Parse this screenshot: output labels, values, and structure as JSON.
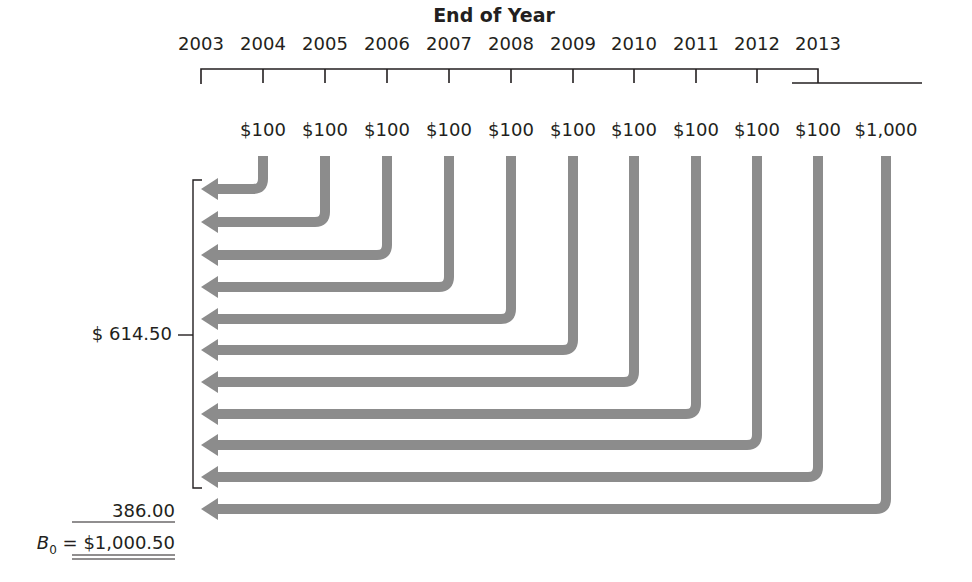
{
  "title": "End of Year",
  "years": [
    "2003",
    "2004",
    "2005",
    "2006",
    "2007",
    "2008",
    "2009",
    "2010",
    "2011",
    "2012",
    "2013"
  ],
  "payments": [
    "$100",
    "$100",
    "$100",
    "$100",
    "$100",
    "$100",
    "$100",
    "$100",
    "$100",
    "$100",
    "$1,000"
  ],
  "payment_types": [
    "coupon",
    "coupon",
    "coupon",
    "coupon",
    "coupon",
    "coupon",
    "coupon",
    "coupon",
    "coupon",
    "coupon",
    "principal"
  ],
  "summary": {
    "coupons_pv_label": "$  614.50",
    "principal_pv_label": "386.00",
    "bond_value_symbol": "B",
    "bond_value_subscript": "0",
    "equals": "=",
    "bond_value": "$1,000.50"
  },
  "colors": {
    "arrow": "#8c8c8c",
    "line": "#231f20",
    "text": "#231f20"
  }
}
